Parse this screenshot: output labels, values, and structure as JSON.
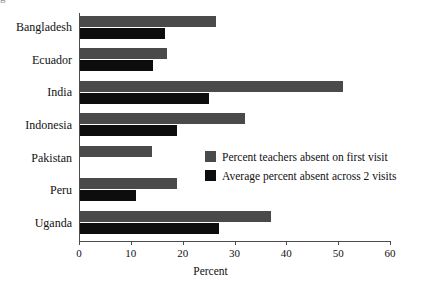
{
  "figure": {
    "title_fragment": "g",
    "background": "#ffffff"
  },
  "chart_data": {
    "type": "bar",
    "orientation": "horizontal",
    "title": "",
    "xlabel": "Percent",
    "ylabel": "",
    "xlim": [
      0,
      60
    ],
    "xticks": [
      0,
      10,
      20,
      30,
      40,
      50,
      60
    ],
    "xtick_labels": [
      "0",
      "10",
      "20",
      "30",
      "40",
      "50",
      "60"
    ],
    "grid": false,
    "legend_position": "center-right inside plot",
    "categories": [
      "Bangladesh",
      "Ecuador",
      "India",
      "Indonesia",
      "Pakistan",
      "Peru",
      "Uganda"
    ],
    "series": [
      {
        "name": "Percent teachers absent on first visit",
        "color": "#4a4a4a",
        "values": [
          26.5,
          17.0,
          51.0,
          32.0,
          14.0,
          19.0,
          37.0
        ]
      },
      {
        "name": "Average percent absent across 2 visits",
        "color": "#0d0d0d",
        "values": [
          16.5,
          14.3,
          25.0,
          19.0,
          null,
          11.0,
          27.0
        ]
      }
    ]
  },
  "legend": {
    "items": [
      {
        "label": "Percent teachers absent on first visit",
        "swatch": "grey"
      },
      {
        "label": "Average percent absent across 2 visits",
        "swatch": "black"
      }
    ]
  },
  "axis": {
    "xlabel": "Percent"
  }
}
